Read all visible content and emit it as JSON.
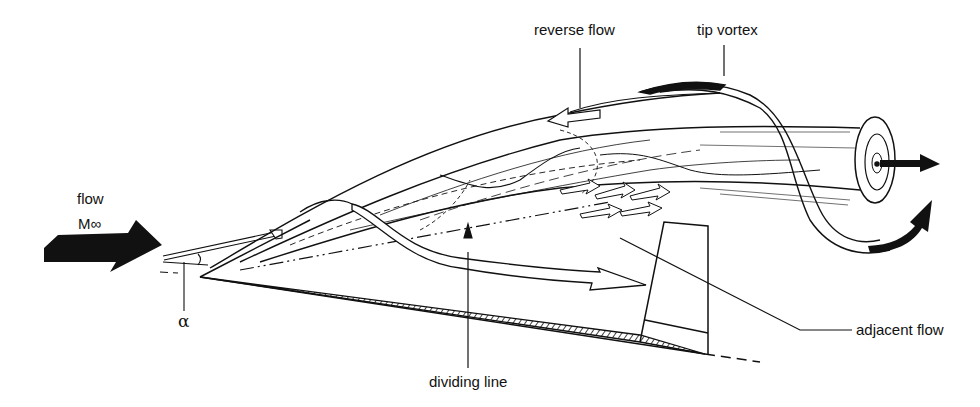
{
  "figure": {
    "type": "schematic",
    "colors": {
      "ink": "#111111",
      "background": "#ffffff"
    }
  },
  "labels": {
    "flow": "flow",
    "mach": "M∞",
    "alpha": "α",
    "reverse_flow": "reverse flow",
    "tip_vortex": "tip vortex",
    "dividing_line": "dividing line",
    "adjacent_flow": "adjacent flow"
  },
  "icons": {
    "freestream_arrow": "solid-right-arrow",
    "axial_outflow_arrow": "solid-right-arrow",
    "swirl_arrow": "solid-curved-arrow",
    "vortex_core": "spiral-icon",
    "hatched_wing_edge": "hatched-triangle"
  }
}
